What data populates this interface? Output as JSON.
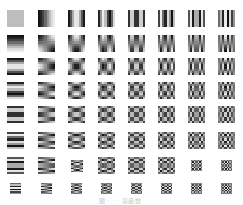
{
  "figure": {
    "caption": "图 · · · 基函数",
    "colors": {
      "dark": "#1a1a1a",
      "light": "#f4f4f4",
      "background": "#ffffff"
    },
    "grid": {
      "rows": 8,
      "cols": 8,
      "col_x": [
        7,
        38,
        68,
        98,
        128,
        158,
        188,
        218
      ],
      "row_y": [
        10,
        35,
        58,
        82,
        106,
        132,
        157,
        180
      ],
      "default_size": 17,
      "cells": [
        [
          {
            "u": 0,
            "v": 0,
            "w": 17,
            "h": 17
          },
          {
            "u": 1,
            "v": 0,
            "w": 17,
            "h": 17
          },
          {
            "u": 2,
            "v": 0,
            "w": 17,
            "h": 17
          },
          {
            "u": 3,
            "v": 0,
            "w": 17,
            "h": 17
          },
          {
            "u": 4,
            "v": 0,
            "w": 17,
            "h": 17
          },
          {
            "u": 5,
            "v": 0,
            "w": 17,
            "h": 17
          },
          {
            "u": 6,
            "v": 0,
            "w": 17,
            "h": 17
          },
          {
            "u": 7,
            "v": 0,
            "w": 17,
            "h": 17
          }
        ],
        [
          {
            "u": 0,
            "v": 1,
            "w": 17,
            "h": 17
          },
          {
            "u": 1,
            "v": 1,
            "w": 17,
            "h": 17
          },
          {
            "u": 2,
            "v": 1,
            "w": 17,
            "h": 17
          },
          {
            "u": 3,
            "v": 1,
            "w": 17,
            "h": 17
          },
          {
            "u": 4,
            "v": 1,
            "w": 17,
            "h": 17
          },
          {
            "u": 5,
            "v": 1,
            "w": 17,
            "h": 17
          },
          {
            "u": 6,
            "v": 1,
            "w": 17,
            "h": 17
          },
          {
            "u": 7,
            "v": 1,
            "w": 17,
            "h": 17
          }
        ],
        [
          {
            "u": 0,
            "v": 2,
            "w": 17,
            "h": 17
          },
          {
            "u": 1,
            "v": 2,
            "w": 17,
            "h": 17
          },
          {
            "u": 2,
            "v": 2,
            "w": 17,
            "h": 17
          },
          {
            "u": 3,
            "v": 2,
            "w": 17,
            "h": 17
          },
          {
            "u": 4,
            "v": 2,
            "w": 17,
            "h": 17
          },
          {
            "u": 5,
            "v": 2,
            "w": 17,
            "h": 17
          },
          {
            "u": 6,
            "v": 2,
            "w": 17,
            "h": 17
          },
          {
            "u": 7,
            "v": 2,
            "w": 17,
            "h": 17
          }
        ],
        [
          {
            "u": 0,
            "v": 3,
            "w": 17,
            "h": 17
          },
          {
            "u": 1,
            "v": 3,
            "w": 17,
            "h": 17
          },
          {
            "u": 2,
            "v": 3,
            "w": 17,
            "h": 17
          },
          {
            "u": 3,
            "v": 3,
            "w": 17,
            "h": 17
          },
          {
            "u": 4,
            "v": 3,
            "w": 17,
            "h": 17
          },
          {
            "u": 5,
            "v": 3,
            "w": 17,
            "h": 17
          },
          {
            "u": 6,
            "v": 3,
            "w": 17,
            "h": 17
          },
          {
            "u": 7,
            "v": 3,
            "w": 17,
            "h": 17
          }
        ],
        [
          {
            "u": 0,
            "v": 4,
            "w": 17,
            "h": 17
          },
          {
            "u": 1,
            "v": 4,
            "w": 17,
            "h": 17
          },
          {
            "u": 2,
            "v": 4,
            "w": 17,
            "h": 17
          },
          {
            "u": 3,
            "v": 4,
            "w": 17,
            "h": 17
          },
          {
            "u": 4,
            "v": 4,
            "w": 17,
            "h": 17
          },
          {
            "u": 5,
            "v": 4,
            "w": 17,
            "h": 17
          },
          {
            "u": 6,
            "v": 4,
            "w": 17,
            "h": 17
          },
          {
            "u": 7,
            "v": 4,
            "w": 17,
            "h": 17
          }
        ],
        [
          {
            "u": 0,
            "v": 5,
            "w": 17,
            "h": 17
          },
          {
            "u": 1,
            "v": 5,
            "w": 17,
            "h": 17
          },
          {
            "u": 2,
            "v": 5,
            "w": 17,
            "h": 17
          },
          {
            "u": 3,
            "v": 5,
            "w": 17,
            "h": 17
          },
          {
            "u": 4,
            "v": 5,
            "w": 17,
            "h": 17
          },
          {
            "u": 5,
            "v": 5,
            "w": 17,
            "h": 17
          },
          {
            "u": 6,
            "v": 5,
            "w": 17,
            "h": 17
          },
          {
            "u": 7,
            "v": 5,
            "w": 17,
            "h": 17
          }
        ],
        [
          {
            "u": 0,
            "v": 6,
            "w": 17,
            "h": 17
          },
          {
            "u": 1,
            "v": 6,
            "w": 17,
            "h": 17
          },
          {
            "u": 2,
            "v": 6,
            "w": 12,
            "h": 12
          },
          {
            "u": 3,
            "v": 6,
            "w": 17,
            "h": 17
          },
          {
            "u": 4,
            "v": 6,
            "w": 17,
            "h": 17
          },
          {
            "u": 5,
            "v": 6,
            "w": 17,
            "h": 17
          },
          {
            "u": 6,
            "v": 6,
            "w": 11,
            "h": 11
          },
          {
            "u": 7,
            "v": 6,
            "w": 11,
            "h": 11
          }
        ],
        [
          {
            "u": 0,
            "v": 7,
            "w": 11,
            "h": 11
          },
          {
            "u": 1,
            "v": 7,
            "w": 11,
            "h": 11
          },
          {
            "u": 2,
            "v": 7,
            "w": 11,
            "h": 11
          },
          {
            "u": 3,
            "v": 7,
            "w": 11,
            "h": 11
          },
          {
            "u": 4,
            "v": 7,
            "w": 11,
            "h": 11
          },
          {
            "u": 5,
            "v": 7,
            "w": 11,
            "h": 11
          },
          {
            "u": 6,
            "v": 7,
            "w": 11,
            "h": 11
          },
          {
            "u": 7,
            "v": 7,
            "w": 11,
            "h": 11
          }
        ]
      ]
    }
  }
}
